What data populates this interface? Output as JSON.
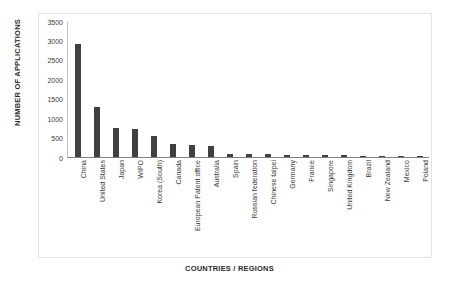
{
  "chart_data": {
    "type": "bar",
    "title": "",
    "subtitle": "",
    "xlabel": "COUNTRIES / REGIONS",
    "ylabel": "NUMBER OF APPLICATIONS",
    "ylim": [
      0,
      3500
    ],
    "ytick_labels": [
      "3500",
      "3000",
      "2500",
      "2000",
      "1500",
      "1000",
      "500",
      "0"
    ],
    "ytick_values": [
      3500,
      3000,
      2500,
      2000,
      1500,
      1000,
      500,
      0
    ],
    "grid": false,
    "legend": null,
    "bar_color": "#404040",
    "categories": [
      "China",
      "United States",
      "Japan",
      "WIPO",
      "Korea (South)",
      "Canada",
      "European Patent office",
      "Australia",
      "Spain",
      "Russian federation",
      "Chinese taipei",
      "Germany",
      "France",
      "Singapore",
      "United Kingdom",
      "Brazil",
      "New Zealand",
      "Mexico",
      "Poland"
    ],
    "values": [
      2900,
      1300,
      750,
      720,
      540,
      330,
      300,
      290,
      80,
      75,
      70,
      55,
      50,
      48,
      45,
      18,
      15,
      12,
      10
    ]
  },
  "axis": {
    "y_title": "NUMBER OF APPLICATIONS",
    "x_title": "COUNTRIES / REGIONS"
  }
}
